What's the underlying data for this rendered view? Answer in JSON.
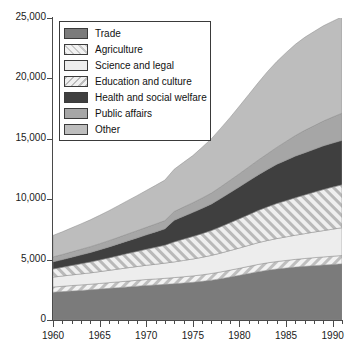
{
  "chart_data": {
    "type": "area",
    "title": "",
    "subtitle": "",
    "xlabel": "",
    "ylabel": "",
    "stacked": true,
    "grid": false,
    "legend_position": "top-left",
    "xlim": [
      1960,
      1991
    ],
    "ylim": [
      0,
      25000
    ],
    "x": [
      1960,
      1961,
      1962,
      1963,
      1964,
      1965,
      1966,
      1967,
      1968,
      1969,
      1970,
      1971,
      1972,
      1973,
      1974,
      1975,
      1976,
      1977,
      1978,
      1979,
      1980,
      1981,
      1982,
      1983,
      1984,
      1985,
      1986,
      1987,
      1988,
      1989,
      1990,
      1991
    ],
    "y_ticks": [
      0,
      5000,
      10000,
      15000,
      20000,
      25000
    ],
    "y_tick_labels": [
      "0",
      "5,000",
      "10,000",
      "15,000",
      "20,000",
      "25,000"
    ],
    "x_ticks": [
      1960,
      1965,
      1970,
      1975,
      1980,
      1985,
      1990
    ],
    "x_tick_labels": [
      "1960",
      "1965",
      "1970",
      "1975",
      "1980",
      "1985",
      "1990"
    ],
    "x_minor_tick_step": 1,
    "series": [
      {
        "name": "Trade",
        "color": "#7b7b7b",
        "pattern": "solid",
        "values": [
          2300,
          2350,
          2400,
          2450,
          2500,
          2560,
          2620,
          2680,
          2740,
          2800,
          2860,
          2900,
          2950,
          3000,
          3060,
          3120,
          3200,
          3300,
          3420,
          3560,
          3700,
          3850,
          4000,
          4120,
          4220,
          4300,
          4380,
          4440,
          4500,
          4550,
          4600,
          4650
        ]
      },
      {
        "name": "Agriculture",
        "color": "#d8d8d8",
        "pattern": "diagonal-hatch-45",
        "values": [
          430,
          440,
          450,
          455,
          460,
          465,
          470,
          475,
          480,
          485,
          490,
          495,
          500,
          510,
          520,
          530,
          540,
          550,
          560,
          570,
          580,
          590,
          600,
          610,
          620,
          630,
          640,
          650,
          660,
          670,
          680,
          690
        ]
      },
      {
        "name": "Science and legal",
        "color": "#ededed",
        "pattern": "solid",
        "values": [
          820,
          850,
          880,
          910,
          940,
          980,
          1020,
          1060,
          1100,
          1140,
          1180,
          1220,
          1260,
          1300,
          1350,
          1400,
          1450,
          1500,
          1560,
          1620,
          1680,
          1740,
          1800,
          1850,
          1900,
          1950,
          2000,
          2060,
          2120,
          2180,
          2240,
          2300
        ]
      },
      {
        "name": "Education and culture",
        "color": "#d2d2d2",
        "pattern": "diagonal-hatch-135",
        "values": [
          670,
          720,
          780,
          840,
          900,
          960,
          1030,
          1100,
          1180,
          1250,
          1320,
          1400,
          1480,
          1650,
          1760,
          1860,
          1960,
          2060,
          2180,
          2300,
          2420,
          2540,
          2660,
          2780,
          2900,
          3000,
          3100,
          3200,
          3300,
          3400,
          3480,
          3550
        ]
      },
      {
        "name": "Health and social welfare",
        "color": "#3f3f3f",
        "pattern": "solid",
        "values": [
          600,
          640,
          690,
          740,
          790,
          850,
          910,
          980,
          1050,
          1120,
          1200,
          1280,
          1360,
          1800,
          1900,
          2000,
          2100,
          2200,
          2350,
          2500,
          2650,
          2800,
          2950,
          3100,
          3250,
          3350,
          3450,
          3500,
          3550,
          3620,
          3650,
          3680
        ]
      },
      {
        "name": "Public affairs",
        "color": "#a6a6a6",
        "pattern": "solid",
        "values": [
          400,
          420,
          440,
          460,
          480,
          500,
          520,
          545,
          570,
          595,
          620,
          650,
          680,
          720,
          760,
          800,
          850,
          900,
          960,
          1020,
          1080,
          1150,
          1220,
          1300,
          1400,
          1550,
          1700,
          1850,
          1950,
          2050,
          2150,
          2250
        ]
      },
      {
        "name": "Other",
        "color": "#bdbdbd",
        "pattern": "solid",
        "values": [
          1780,
          1880,
          1990,
          2100,
          2220,
          2350,
          2480,
          2620,
          2760,
          2900,
          3050,
          3200,
          3350,
          3500,
          3700,
          3900,
          4200,
          4500,
          4850,
          5200,
          5600,
          6000,
          6400,
          6800,
          7100,
          7350,
          7550,
          7700,
          7800,
          7880,
          7930,
          7980
        ]
      }
    ],
    "totals_note": "",
    "annotations": []
  },
  "legend": {
    "items": [
      {
        "label": "Trade",
        "swatch": "sw-trade"
      },
      {
        "label": "Agriculture",
        "swatch": "sw-agri"
      },
      {
        "label": "Science and legal",
        "swatch": "sw-sci"
      },
      {
        "label": "Education and culture",
        "swatch": "sw-edu"
      },
      {
        "label": "Health and social welfare",
        "swatch": "sw-health"
      },
      {
        "label": "Public affairs",
        "swatch": "sw-public"
      },
      {
        "label": "Other",
        "swatch": "sw-other"
      }
    ]
  }
}
